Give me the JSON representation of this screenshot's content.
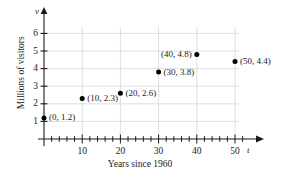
{
  "chart_data": {
    "type": "scatter",
    "title": "",
    "xlabel": "Years since 1960",
    "ylabel": "Millions of visitors",
    "x_axis_symbol": "t",
    "y_axis_symbol": "v",
    "xlim": [
      0,
      54
    ],
    "ylim": [
      0,
      6.6
    ],
    "grid": true,
    "legend": "none",
    "x_major_ticks": [
      10,
      20,
      30,
      40,
      50
    ],
    "x_major_tick_labels": [
      "10",
      "20",
      "30",
      "40",
      "50"
    ],
    "x_minor_tick_step": 2,
    "y_ticks": [
      1,
      2,
      3,
      4,
      5,
      6
    ],
    "y_tick_labels": [
      "1",
      "2",
      "3",
      "4",
      "5",
      "6"
    ],
    "points": [
      {
        "x": 0,
        "y": 1.2,
        "label": "(0, 1.2)",
        "label_side": "right"
      },
      {
        "x": 10,
        "y": 2.3,
        "label": "(10, 2.3)",
        "label_side": "right"
      },
      {
        "x": 20,
        "y": 2.6,
        "label": "(20, 2.6)",
        "label_side": "right"
      },
      {
        "x": 30,
        "y": 3.8,
        "label": "(30, 3.8)",
        "label_side": "right"
      },
      {
        "x": 40,
        "y": 4.8,
        "label": "(40, 4.8)",
        "label_side": "left"
      },
      {
        "x": 50,
        "y": 4.4,
        "label": "(50, 4.4)",
        "label_side": "right"
      }
    ],
    "marker": {
      "shape": "circle",
      "color": "#000000",
      "size": 5
    },
    "colors": {
      "axis": "#1a1a1a",
      "grid": "#d8d8d8",
      "marker": "#000000",
      "text": "#1a1a1a",
      "background": "#ffffff"
    }
  }
}
